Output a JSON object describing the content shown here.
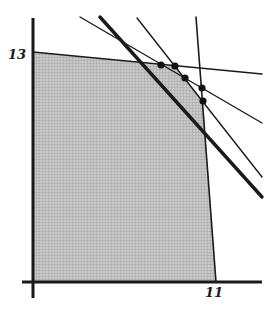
{
  "diagram": {
    "type": "feasible-region-plot",
    "colors": {
      "background": "#ffffff",
      "region_fill": "#bdbdbd",
      "line": "#1a1a1a",
      "point": "#111111"
    },
    "axes": {
      "origin": [
        33,
        282
      ],
      "y_axis": {
        "x": 33,
        "top": 18,
        "bottom": 298
      },
      "x_axis": {
        "y": 282,
        "left": 22,
        "right": 262
      },
      "y_tick_label": "13",
      "x_tick_label": "11"
    },
    "region": {
      "vertices": [
        [
          33,
          52
        ],
        [
          161,
          65
        ],
        [
          175,
          66
        ],
        [
          185,
          78
        ],
        [
          203,
          101
        ],
        [
          216,
          282
        ],
        [
          33,
          282
        ]
      ]
    },
    "lines": [
      {
        "name": "constraint-line-horizontal",
        "from": [
          33,
          52
        ],
        "to": [
          262,
          74
        ],
        "width": 1.6
      },
      {
        "name": "constraint-line-shallow",
        "from": [
          80,
          17
        ],
        "to": [
          262,
          123
        ],
        "width": 1.4
      },
      {
        "name": "constraint-line-steep",
        "from": [
          137,
          18
        ],
        "to": [
          262,
          177
        ],
        "width": 1.4
      },
      {
        "name": "constraint-line-vertical",
        "from": [
          196,
          17
        ],
        "to": [
          216,
          282
        ],
        "width": 1.6
      },
      {
        "name": "objective-line-thick",
        "from": [
          100,
          17
        ],
        "to": [
          262,
          197
        ],
        "width": 3.4
      }
    ],
    "points": [
      [
        161,
        65
      ],
      [
        175,
        66
      ],
      [
        185,
        78
      ],
      [
        202,
        88
      ],
      [
        203,
        101
      ]
    ]
  }
}
